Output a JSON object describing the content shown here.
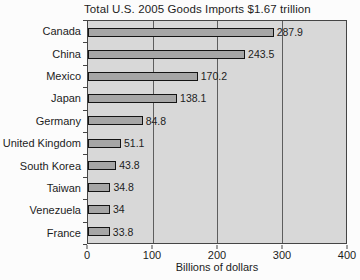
{
  "title": "Total U.S. 2005 Goods Imports $1.67 trillion",
  "x_axis_title": "Billions of dollars",
  "chart_data": {
    "type": "bar",
    "orientation": "horizontal",
    "title": "Total U.S. 2005 Goods Imports $1.67 trillion",
    "xlabel": "Billions of dollars",
    "ylabel": "",
    "categories": [
      "Canada",
      "China",
      "Mexico",
      "Japan",
      "Germany",
      "United Kingdom",
      "South Korea",
      "Taiwan",
      "Venezuela",
      "France"
    ],
    "values": [
      287.9,
      243.5,
      170.2,
      138.1,
      84.8,
      51.1,
      43.8,
      34.8,
      34,
      33.8
    ],
    "value_labels": [
      "287.9",
      "243.5",
      "170.2",
      "138.1",
      "84.8",
      "51.1",
      "43.8",
      "34.8",
      "34",
      "33.8"
    ],
    "xlim": [
      0,
      400
    ],
    "x_ticks": [
      0,
      100,
      200,
      300,
      400
    ],
    "gridlines_x": [
      100,
      200,
      300
    ],
    "grid": "vertical-on",
    "legend": "none",
    "colors": {
      "bar_fill": "#a6a6a6",
      "bar_border": "#141414",
      "plot_bg": "#d8d8d8",
      "plot_border": "#454545",
      "gridline": "#5e5e5e",
      "text": "#1c1c1c",
      "page_bg": "#fcfcfc"
    }
  }
}
